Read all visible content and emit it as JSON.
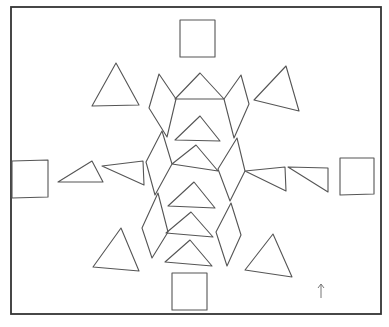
{
  "figure": {
    "frame": {
      "x": 11,
      "y": 7,
      "width": 370,
      "height": 307
    },
    "stroke_color": "#555555",
    "frame_color": "#333333",
    "squares": [
      {
        "name": "top-square",
        "points": "180,20 215,20 215,57 180,57"
      },
      {
        "name": "left-square",
        "points": "12,161 48,160 48,197 12,198"
      },
      {
        "name": "right-square",
        "points": "340,158 374,158 374,194 340,195"
      },
      {
        "name": "bottom-square",
        "points": "172,273 207,273 207,310 172,310"
      }
    ],
    "outer_triangles": [
      {
        "name": "top-left-triangle",
        "points": "116,63 92,106 139,105"
      },
      {
        "name": "top-right-triangle",
        "points": "286,66 254,100 299,111"
      },
      {
        "name": "bottom-left-triangle",
        "points": "121,228 93,267 139,271"
      },
      {
        "name": "bottom-right-triangle",
        "points": "273,234 245,270 292,277"
      }
    ],
    "side_triangles": [
      {
        "name": "left-inner-triangle-1",
        "points": "58,182 92,161 103,182"
      },
      {
        "name": "left-inner-triangle-2",
        "points": "102,166 143,161 144,185"
      },
      {
        "name": "right-inner-triangle-1",
        "points": "245,171 285,167 286,191"
      },
      {
        "name": "right-inner-triangle-2",
        "points": "288,167 328,168 328,192"
      }
    ],
    "center_triangles": [
      {
        "name": "center-triangle-1",
        "points": "175,99 200,73 224,99"
      },
      {
        "name": "center-triangle-2",
        "points": "175,140 200,116 220,141"
      },
      {
        "name": "center-triangle-3",
        "points": "172,164 196,145 218,171"
      },
      {
        "name": "center-triangle-4",
        "points": "168,206 194,182 215,208"
      },
      {
        "name": "center-triangle-5",
        "points": "166,233 191,212 213,237"
      },
      {
        "name": "center-triangle-6",
        "points": "165,262 190,240 212,266"
      }
    ],
    "rhombi": [
      {
        "name": "left-rhombus-1",
        "points": "159,74 176,99 167,137 149,108"
      },
      {
        "name": "left-rhombus-2",
        "points": "162,131 172,164 155,195 146,162"
      },
      {
        "name": "left-rhombus-3",
        "points": "158,193 168,232 152,258 142,228"
      },
      {
        "name": "right-rhombus-1",
        "points": "241,75 249,104 234,138 224,99"
      },
      {
        "name": "right-rhombus-2",
        "points": "237,138 245,171 230,201 218,169"
      },
      {
        "name": "right-rhombus-3",
        "points": "231,203 241,235 227,266 216,232"
      }
    ],
    "arrow": {
      "name": "up-arrow",
      "x": 321,
      "y_top": 284,
      "y_bottom": 298
    }
  }
}
